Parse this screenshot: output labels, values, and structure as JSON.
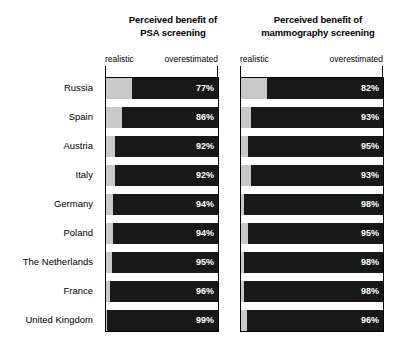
{
  "chart_data": {
    "type": "bar",
    "orientation": "horizontal",
    "stacked": true,
    "title": "",
    "xlabel": "",
    "ylabel": "",
    "xlim": [
      0,
      100
    ],
    "grid": false,
    "legend_position": "top",
    "categories": [
      "Russia",
      "Spain",
      "Austria",
      "Italy",
      "Germany",
      "Poland",
      "The Netherlands",
      "France",
      "United Kingdom"
    ],
    "panels": [
      {
        "title_line1": "Perceived benefit of",
        "title_line2": "PSA screening",
        "axis_left_label": "realistic",
        "axis_right_label": "overestimated",
        "series": [
          {
            "name": "realistic",
            "values": [
              23,
              14,
              8,
              8,
              6,
              6,
              5,
              4,
              1
            ]
          },
          {
            "name": "overestimated",
            "values": [
              77,
              86,
              92,
              92,
              94,
              94,
              95,
              96,
              99
            ]
          }
        ],
        "value_labels": [
          "77%",
          "86%",
          "92%",
          "92%",
          "94%",
          "94%",
          "95%",
          "96%",
          "99%"
        ]
      },
      {
        "title_line1": "Perceived benefit of",
        "title_line2": "mammography screening",
        "axis_left_label": "realistic",
        "axis_right_label": "overestimated",
        "series": [
          {
            "name": "realistic",
            "values": [
              18,
              7,
              5,
              7,
              2,
              5,
              2,
              2,
              4
            ]
          },
          {
            "name": "overestimated",
            "values": [
              82,
              93,
              95,
              93,
              98,
              95,
              98,
              98,
              96
            ]
          }
        ],
        "value_labels": [
          "82%",
          "93%",
          "95%",
          "93%",
          "98%",
          "95%",
          "98%",
          "98%",
          "96%"
        ]
      }
    ],
    "colors": {
      "realistic": "#c9c9c9",
      "overestimated": "#181818",
      "value_text": "#ffffff",
      "frame": "#000000",
      "background": "#ffffff"
    }
  }
}
